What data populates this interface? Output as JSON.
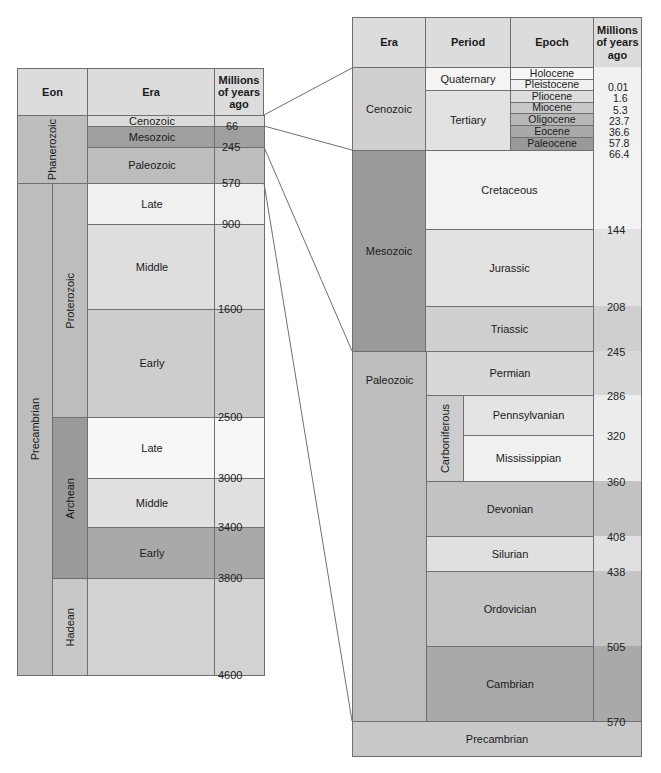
{
  "left_table": {
    "headers": {
      "eon": "Eon",
      "era": "Era",
      "ma": "Millions of years ago"
    },
    "eons": [
      {
        "label": "Phanerozoic",
        "vertical": true
      },
      {
        "label": "Precambrian",
        "vertical": true
      }
    ],
    "precambrian_subeons": [
      {
        "label": "Proterozoic"
      },
      {
        "label": "Archean"
      },
      {
        "label": "Hadean"
      }
    ],
    "eras": [
      {
        "label": "Cenozoic",
        "end_ma": "66"
      },
      {
        "label": "Mesozoic",
        "end_ma": "245"
      },
      {
        "label": "Paleozoic",
        "end_ma": "570"
      },
      {
        "label": "Late",
        "end_ma": "900"
      },
      {
        "label": "Middle",
        "end_ma": "1600"
      },
      {
        "label": "Early",
        "end_ma": "2500"
      },
      {
        "label": "Late",
        "end_ma": "3000"
      },
      {
        "label": "Middle",
        "end_ma": "3400"
      },
      {
        "label": "Early",
        "end_ma": "3800"
      },
      {
        "label": "",
        "end_ma": "4600"
      }
    ]
  },
  "right_table": {
    "headers": {
      "era": "Era",
      "period": "Period",
      "epoch": "Epoch",
      "ma": "Millions of years ago"
    },
    "eras": [
      {
        "label": "Cenozoic"
      },
      {
        "label": "Mesozoic"
      },
      {
        "label": "Paleozoic"
      },
      {
        "label": "Precambrian"
      }
    ],
    "periods": [
      {
        "label": "Quaternary"
      },
      {
        "label": "Tertiary"
      },
      {
        "label": "Cretaceous",
        "end_ma": "144"
      },
      {
        "label": "Jurassic",
        "end_ma": "208"
      },
      {
        "label": "Triassic",
        "end_ma": "245"
      },
      {
        "label": "Permian",
        "end_ma": "286"
      },
      {
        "label": "Carboniferous"
      },
      {
        "label": "Devonian",
        "end_ma": "408"
      },
      {
        "label": "Silurian",
        "end_ma": "438"
      },
      {
        "label": "Ordovician",
        "end_ma": "505"
      },
      {
        "label": "Cambrian",
        "end_ma": "570"
      }
    ],
    "subperiods": [
      {
        "label": "Pennsylvanian",
        "end_ma": "320"
      },
      {
        "label": "Mississippian",
        "end_ma": "360"
      }
    ],
    "epochs": [
      {
        "label": "Holocene",
        "end_ma": "0.01"
      },
      {
        "label": "Pleistocene",
        "end_ma": "1.6"
      },
      {
        "label": "Pliocene",
        "end_ma": "5.3"
      },
      {
        "label": "Miocene",
        "end_ma": "23.7"
      },
      {
        "label": "Oligocene",
        "end_ma": "36.6"
      },
      {
        "label": "Eocene",
        "end_ma": "57.8"
      },
      {
        "label": "Paleocene",
        "end_ma": "66.4"
      }
    ]
  },
  "colors": {
    "header": "#dcdcdc",
    "lightest": "#f3f3f3",
    "light": "#e2e2e2",
    "mid": "#d0d0d0",
    "midDark": "#bdbdbd",
    "dark": "#a9a9a9",
    "darker": "#9a9a9a",
    "line": "#6f6f6f"
  }
}
